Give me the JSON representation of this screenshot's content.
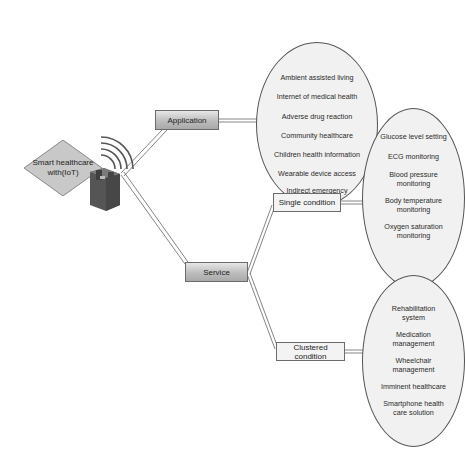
{
  "root": {
    "label_line1": "Smart healthcare",
    "label_line2": "with(IoT)",
    "icon": "iot-device-wifi-icon"
  },
  "branches": {
    "application": {
      "label": "Application",
      "items": [
        "Ambient  assisted living",
        "Internet of medical health",
        "Adverse drug reaction",
        "Community healthcare",
        "Children health information",
        "Wearable device access",
        "Indirect emergency",
        "healthcare"
      ]
    },
    "service": {
      "label": "Service",
      "single": {
        "label": "Single condition",
        "items": [
          "Glucose level setting",
          "ECG monitoring",
          "Blood pressure",
          "monitoring",
          "Body temperature",
          "monitoring",
          "Oxygen saturation",
          "monitoring"
        ]
      },
      "clustered": {
        "label": "Clustered condition",
        "items": [
          "Rehabilitation",
          "system",
          "Medication",
          "management",
          "Wheelchair",
          "management",
          "Imminent healthcare",
          "Smartphone health",
          "care solution"
        ]
      }
    }
  },
  "colors": {
    "node_gradient_top": "#e6e6e6",
    "node_gradient_bottom": "#a9a9a9",
    "ellipse_fill": "#f1f1f1",
    "diamond_fill": "#c8c8c8",
    "device_fill": "#5a5a5a"
  }
}
